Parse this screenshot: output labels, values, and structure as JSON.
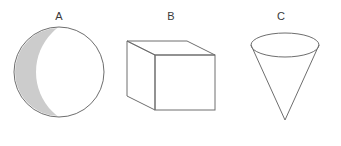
{
  "figure": {
    "title": "",
    "background_color": "#ffffff",
    "stroke_color": "#6e6e6e",
    "shade_color": "#cccccc",
    "label_color": "#3a3a3a",
    "shapes": [
      {
        "label": "A",
        "name": "sphere-circle-shaded",
        "type": "circle",
        "shaded": true,
        "shade_description": "crescent",
        "center_x": 59,
        "center_y": 72,
        "radius": 45
      },
      {
        "label": "B",
        "name": "rectangular-prism",
        "type": "box",
        "shaded": false,
        "front_face": {
          "x": 155,
          "y": 55,
          "width": 60,
          "height": 55
        },
        "depth_offset_x": -28,
        "depth_offset_y": -14
      },
      {
        "label": "C",
        "name": "inverted-cone",
        "type": "cone",
        "shaded": false,
        "ellipse_center_x": 285,
        "ellipse_center_y": 45,
        "ellipse_rx": 34,
        "ellipse_ry": 12,
        "apex_x": 285,
        "apex_y": 120
      }
    ],
    "labels": [
      {
        "text": "A",
        "x": 59,
        "y": 16
      },
      {
        "text": "B",
        "x": 171,
        "y": 16
      },
      {
        "text": "C",
        "x": 281,
        "y": 16
      }
    ]
  }
}
